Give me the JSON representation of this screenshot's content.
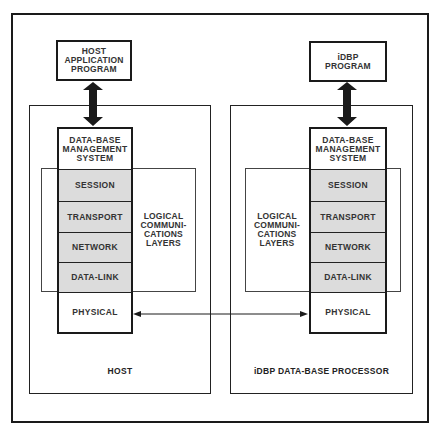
{
  "diagram": {
    "host": {
      "program_label": "HOST\nAPPLICATION\nPROGRAM",
      "machine_label": "HOST",
      "logical_label": "LOGICAL\nCOMMUNI-\nCATIONS\nLAYERS",
      "stack": {
        "dbms": "DATA-BASE\nMANAGEMENT\nSYSTEM",
        "session": "SESSION",
        "transport": "TRANSPORT",
        "network": "NETWORK",
        "data_link": "DATA-LINK",
        "physical": "PHYSICAL"
      }
    },
    "idbp": {
      "program_label": "iDBP\nPROGRAM",
      "machine_label": "iDBP DATA-BASE PROCESSOR",
      "logical_label": "LOGICAL\nCOMMUNI-\nCATIONS\nLAYERS",
      "stack": {
        "dbms": "DATA-BASE\nMANAGEMENT\nSYSTEM",
        "session": "SESSION",
        "transport": "TRANSPORT",
        "network": "NETWORK",
        "data_link": "DATA-LINK",
        "physical": "PHYSICAL"
      }
    },
    "colors": {
      "line": "#1a1a1a",
      "logical_layer_fill": "#dcdcdc",
      "background": "#ffffff"
    },
    "connections": [
      {
        "from": "host-application-program",
        "to": "host-dbms",
        "type": "bidirectional-thick"
      },
      {
        "from": "idbp-program",
        "to": "idbp-dbms",
        "type": "bidirectional-thick"
      },
      {
        "from": "host-physical",
        "to": "idbp-physical",
        "type": "bidirectional-thin"
      }
    ]
  }
}
